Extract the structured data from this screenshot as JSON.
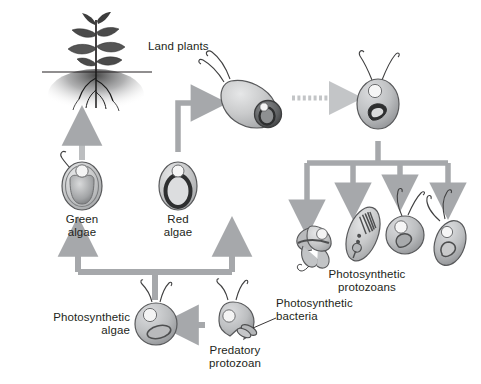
{
  "figure": {
    "background_color": "#ffffff",
    "arrow_color": "#a6a8ab",
    "arrow_color_light": "#c3c5c7",
    "text_color": "#231f20",
    "cell_fill_light": "#d6d7d8",
    "cell_fill_mid": "#b2b4b6",
    "cell_fill_dark": "#6d6e70",
    "outline_color": "#58595b"
  },
  "labels": {
    "land_plants": "Land plants",
    "green_algae": "Green\nalgae",
    "red_algae": "Red\nalgae",
    "photosynthetic_algae": "Photosynthetic\nalgae",
    "photosynthetic_bacteria": "Photosynthetic\nbacteria",
    "predatory_protozoan": "Predatory\nprotozoan",
    "photosynthetic_protozoans": "Photosynthetic\nprotozoans"
  },
  "nodes": [
    {
      "id": "land-plants",
      "label": "Land plants",
      "type": "plant",
      "x": 100,
      "y": 60
    },
    {
      "id": "green-algae",
      "label": "Green algae",
      "type": "cell",
      "x": 82,
      "y": 182
    },
    {
      "id": "red-algae",
      "label": "Red algae",
      "type": "cell",
      "x": 178,
      "y": 182
    },
    {
      "id": "photosynthetic-algae",
      "label": "Photosynthetic algae",
      "type": "cell",
      "x": 155,
      "y": 325
    },
    {
      "id": "predatory-protozoan",
      "label": "Predatory protozoan",
      "type": "cell",
      "x": 235,
      "y": 322
    },
    {
      "id": "photosynthetic-bacteria",
      "label": "Photosynthetic bacteria",
      "type": "organelle",
      "x": 258,
      "y": 330
    },
    {
      "id": "engulfing-protozoan",
      "label": "Protozoan engulfing red alga",
      "type": "cell",
      "x": 248,
      "y": 103
    },
    {
      "id": "secondary-endosymbiont",
      "label": "Secondary endosymbiotic cell",
      "type": "cell",
      "x": 378,
      "y": 103
    },
    {
      "id": "protozoan-1",
      "label": "Photosynthetic protozoan 1",
      "type": "cell",
      "x": 317,
      "y": 241
    },
    {
      "id": "protozoan-2",
      "label": "Photosynthetic protozoan 2",
      "type": "cell",
      "x": 363,
      "y": 232
    },
    {
      "id": "protozoan-3",
      "label": "Photosynthetic protozoan 3",
      "type": "cell",
      "x": 404,
      "y": 235
    },
    {
      "id": "protozoan-4",
      "label": "Photosynthetic protozoan 4",
      "type": "cell",
      "x": 448,
      "y": 240
    }
  ],
  "edges": [
    {
      "id": "edge-algae-to-green-red",
      "from": "photosynthetic-algae",
      "to": "green-algae,red-algae",
      "style": "branching"
    },
    {
      "id": "edge-green-to-plants",
      "from": "green-algae",
      "to": "land-plants",
      "style": "straight"
    },
    {
      "id": "edge-bacteria-to-algae",
      "from": "predatory-protozoan",
      "to": "photosynthetic-algae",
      "style": "straight"
    },
    {
      "id": "edge-red-to-engulfing",
      "from": "red-algae",
      "to": "engulfing-protozoan",
      "style": "elbow"
    },
    {
      "id": "edge-engulfing-to-secondary",
      "from": "engulfing-protozoan",
      "to": "secondary-endosymbiont",
      "style": "dotted"
    },
    {
      "id": "edge-secondary-to-protozoans",
      "from": "secondary-endosymbiont",
      "to": "protozoan-1,protozoan-2,protozoan-3,protozoan-4",
      "style": "branching"
    }
  ]
}
